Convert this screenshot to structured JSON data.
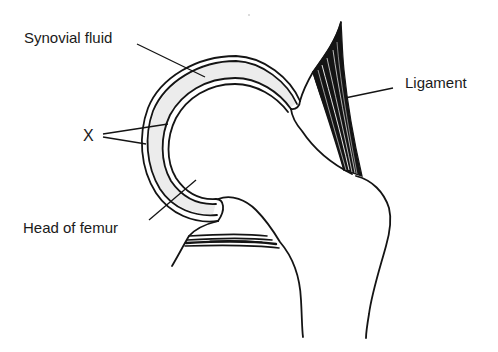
{
  "diagram": {
    "labels": {
      "synovial_fluid": "Synovial fluid",
      "x": "X",
      "ligament": "Ligament",
      "head_of_femur": "Head of femur"
    },
    "colors": {
      "ink": "#141414",
      "synovial_fill": "#ececec",
      "background": "#ffffff"
    }
  }
}
